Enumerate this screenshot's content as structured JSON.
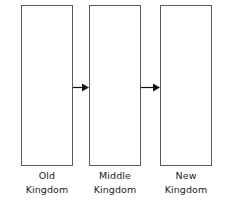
{
  "diagram": {
    "background_color": "#ffffff",
    "line_color": "#5a5a5a",
    "arrow_color": "#111111",
    "text_color": "#1b1b1b",
    "periods": [
      {
        "id": "old-kingdom",
        "label_line1": "Old",
        "label_line2": "Kingdom",
        "box": {
          "x": 21,
          "y": 5,
          "width": 52,
          "height": 161
        }
      },
      {
        "id": "middle-kingdom",
        "label_line1": "Middle",
        "label_line2": "Kingdom",
        "box": {
          "x": 89,
          "y": 5,
          "width": 52,
          "height": 161
        }
      },
      {
        "id": "new-kingdom",
        "label_line1": "New",
        "label_line2": "Kingdom",
        "box": {
          "x": 160,
          "y": 5,
          "width": 52,
          "height": 161
        }
      }
    ],
    "arrows": [
      {
        "id": "arrow-old-to-middle",
        "x": 73,
        "y": 82,
        "length": 16
      },
      {
        "id": "arrow-middle-to-new",
        "x": 141,
        "y": 82,
        "length": 19
      }
    ]
  }
}
